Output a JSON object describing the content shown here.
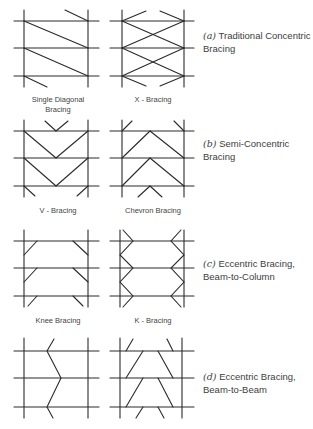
{
  "figure": {
    "sections": [
      {
        "id": "a",
        "letter": "(a)",
        "caption_line1": "Traditional Concentric",
        "caption_line2": "Bracing",
        "panels": [
          {
            "label_line1": "Single Diagonal",
            "label_line2": "Bracing"
          },
          {
            "label_line1": "X - Bracing",
            "label_line2": ""
          }
        ]
      },
      {
        "id": "b",
        "letter": "(b)",
        "caption_line1": "Semi-Concentric",
        "caption_line2": "Bracing",
        "panels": [
          {
            "label_line1": "V - Bracing",
            "label_line2": ""
          },
          {
            "label_line1": "Chevron Bracing",
            "label_line2": ""
          }
        ]
      },
      {
        "id": "c",
        "letter": "(c)",
        "caption_line1": "Eccentric Bracing,",
        "caption_line2": "Beam-to-Column",
        "panels": [
          {
            "label_line1": "Knee Bracing",
            "label_line2": ""
          },
          {
            "label_line1": "K - Bracing",
            "label_line2": ""
          }
        ]
      },
      {
        "id": "d",
        "letter": "(d)",
        "caption_line1": "Eccentric Bracing,",
        "caption_line2": "Beam-to-Beam",
        "panels": [
          {
            "label_line1": "",
            "label_line2": ""
          },
          {
            "label_line1": "",
            "label_line2": ""
          }
        ]
      }
    ],
    "line_color": "#2a2a2a"
  }
}
